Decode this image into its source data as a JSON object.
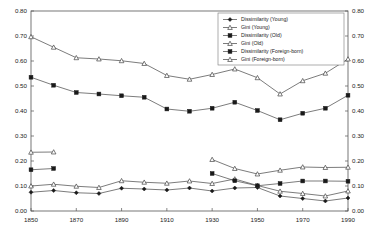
{
  "chart_data": {
    "type": "line",
    "title": "",
    "xlabel": "",
    "ylabel": "",
    "xlim": [
      1850,
      1990
    ],
    "ylim": [
      0.0,
      0.8
    ],
    "ytick_labels": [
      "0.80",
      "0.70",
      "0.60",
      "0.50",
      "0.40",
      "0.30",
      "0.20",
      "0.10",
      "0.00"
    ],
    "ytick_values": [
      0.8,
      0.7,
      0.6,
      0.5,
      0.4,
      0.3,
      0.2,
      0.1,
      0.0
    ],
    "ytick_labels_right": [
      "0.80",
      "0.70",
      "0.60",
      "0.50",
      "0.40",
      "0.30",
      "0.20",
      "0.10",
      "0.00"
    ],
    "xtick_labels": [
      "1850",
      "1870",
      "1890",
      "1910",
      "1930",
      "1950",
      "1970",
      "1990"
    ],
    "xtick_values": [
      1850,
      1870,
      1890,
      1910,
      1930,
      1950,
      1970,
      1990
    ],
    "grid": false,
    "dual_y_axis": true,
    "legend_position": "top-right",
    "x": [
      1850,
      1860,
      1870,
      1880,
      1890,
      1900,
      1910,
      1920,
      1930,
      1940,
      1950,
      1960,
      1970,
      1980,
      1990
    ],
    "series": [
      {
        "name": "Dissimilarity (Young)",
        "marker": "filled-diamond",
        "x": [
          1850,
          1860,
          1870,
          1880,
          1890,
          1900,
          1910,
          1920,
          1930,
          1940,
          1950,
          1960,
          1970,
          1980,
          1990
        ],
        "values": [
          0.075,
          0.082,
          0.073,
          0.07,
          0.091,
          0.088,
          0.084,
          0.092,
          0.08,
          0.092,
          0.094,
          0.06,
          0.05,
          0.04,
          0.052
        ]
      },
      {
        "name": "Gini (Young)",
        "marker": "open-triangle",
        "x": [
          1850,
          1860,
          1870,
          1880,
          1890,
          1900,
          1910,
          1920,
          1930,
          1940,
          1950,
          1960,
          1970,
          1980,
          1990
        ],
        "values": [
          0.1,
          0.107,
          0.099,
          0.094,
          0.121,
          0.115,
          0.111,
          0.12,
          0.11,
          0.128,
          0.102,
          0.079,
          0.07,
          0.06,
          0.08
        ]
      },
      {
        "name": "Dissimilarity (Old)",
        "marker": "filled-square",
        "x": [
          1850,
          1860,
          1870,
          1880,
          1890,
          1900,
          1910,
          1920,
          1930,
          1940,
          1950,
          1960,
          1970,
          1980,
          1990
        ],
        "values": [
          0.535,
          0.503,
          0.474,
          0.468,
          0.461,
          0.455,
          0.408,
          0.399,
          0.411,
          0.435,
          0.402,
          0.365,
          0.391,
          0.411,
          0.463
        ]
      },
      {
        "name": "Gini (Old)",
        "marker": "open-triangle",
        "x": [
          1850,
          1860,
          1870,
          1880,
          1890,
          1900,
          1910,
          1920,
          1930,
          1940,
          1950,
          1960,
          1970,
          1980,
          1990
        ],
        "values": [
          0.697,
          0.655,
          0.613,
          0.608,
          0.601,
          0.59,
          0.542,
          0.527,
          0.546,
          0.568,
          0.533,
          0.468,
          0.521,
          0.551,
          0.608
        ]
      },
      {
        "name": "Dissimilarity (Foreign-born)",
        "marker": "filled-square",
        "x": [
          1850,
          1860,
          1930,
          1940,
          1950,
          1960,
          1970,
          1980,
          1990
        ],
        "values": [
          0.165,
          0.17,
          0.15,
          0.121,
          0.101,
          0.11,
          0.12,
          0.12,
          0.119
        ]
      },
      {
        "name": "Gini (Foreign-born)",
        "marker": "open-triangle",
        "x": [
          1850,
          1860,
          1930,
          1940,
          1950,
          1960,
          1970,
          1980,
          1990
        ],
        "values": [
          0.235,
          0.236,
          0.206,
          0.17,
          0.148,
          0.163,
          0.176,
          0.174,
          0.175
        ]
      }
    ],
    "legend": [
      "Dissimilarity (Young)",
      "Gini (Young)",
      "Dissimilarity (Old)",
      "Gini (Old)",
      "Dissimilarity (Foreign-born)",
      "Gini (Foreign-born)"
    ]
  }
}
